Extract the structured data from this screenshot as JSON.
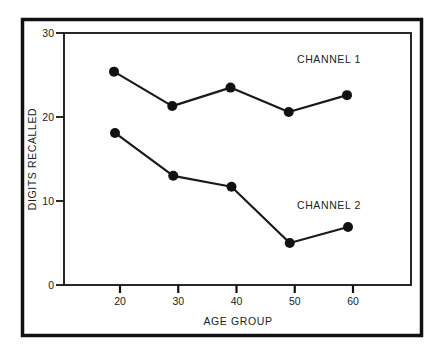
{
  "chart_data": {
    "type": "line",
    "title": "",
    "xlabel": "AGE GROUP",
    "ylabel": "DIGITS RECALLED",
    "x": [
      20,
      30,
      40,
      50,
      60
    ],
    "x_tick_labels": [
      "20",
      "30",
      "40",
      "50",
      "60"
    ],
    "y_tick_labels": [
      "0",
      "10",
      "20",
      "30"
    ],
    "y_ticks": [
      0,
      10,
      20,
      30
    ],
    "ylim": [
      0,
      30
    ],
    "xlim": [
      10,
      70
    ],
    "grid": false,
    "legend": "inline labels",
    "series": [
      {
        "name": "CHANNEL 1",
        "values": [
          25.4,
          21.3,
          23.5,
          20.6,
          22.6
        ]
      },
      {
        "name": "CHANNEL 2",
        "values": [
          18.1,
          13.0,
          11.7,
          5.0,
          6.9
        ]
      }
    ],
    "colors": {
      "line": "#1a1a1a",
      "marker": "#111111",
      "frame": "#111111"
    }
  }
}
